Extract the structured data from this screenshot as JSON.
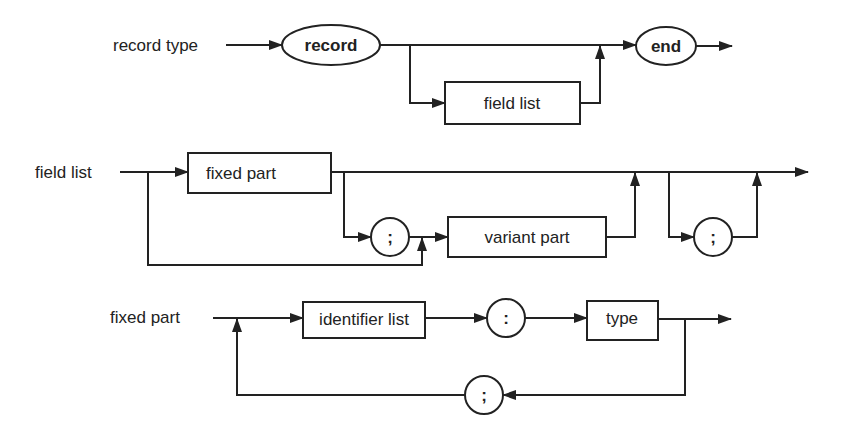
{
  "diagram": {
    "type": "syntax-diagram",
    "rules": [
      {
        "name": "record type",
        "elements": [
          {
            "kind": "terminal",
            "shape": "oval",
            "text": "record"
          },
          {
            "kind": "nonterminal",
            "shape": "box",
            "text": "field list",
            "optional": true
          },
          {
            "kind": "terminal",
            "shape": "oval",
            "text": "end"
          }
        ]
      },
      {
        "name": "field list",
        "elements": [
          {
            "kind": "nonterminal",
            "shape": "box",
            "text": "fixed part",
            "optional": true
          },
          {
            "kind": "terminal",
            "shape": "circle",
            "text": ";"
          },
          {
            "kind": "nonterminal",
            "shape": "box",
            "text": "variant part",
            "optional": true
          },
          {
            "kind": "terminal",
            "shape": "circle",
            "text": ";",
            "optional": true
          }
        ]
      },
      {
        "name": "fixed part",
        "elements": [
          {
            "kind": "nonterminal",
            "shape": "box",
            "text": "identifier list"
          },
          {
            "kind": "terminal",
            "shape": "circle",
            "text": ":"
          },
          {
            "kind": "nonterminal",
            "shape": "box",
            "text": "type"
          },
          {
            "kind": "terminal",
            "shape": "circle",
            "text": ";",
            "loop_back": true
          }
        ]
      }
    ]
  },
  "labels": {
    "r1_name": "record type",
    "r1_record": "record",
    "r1_fieldlist": "field list",
    "r1_end": "end",
    "r2_name": "field list",
    "r2_fixed": "fixed part",
    "r2_semi1": ";",
    "r2_variant": "variant part",
    "r2_semi2": ";",
    "r3_name": "fixed part",
    "r3_idlist": "identifier list",
    "r3_colon": ":",
    "r3_type": "type",
    "r3_semi": ";"
  }
}
